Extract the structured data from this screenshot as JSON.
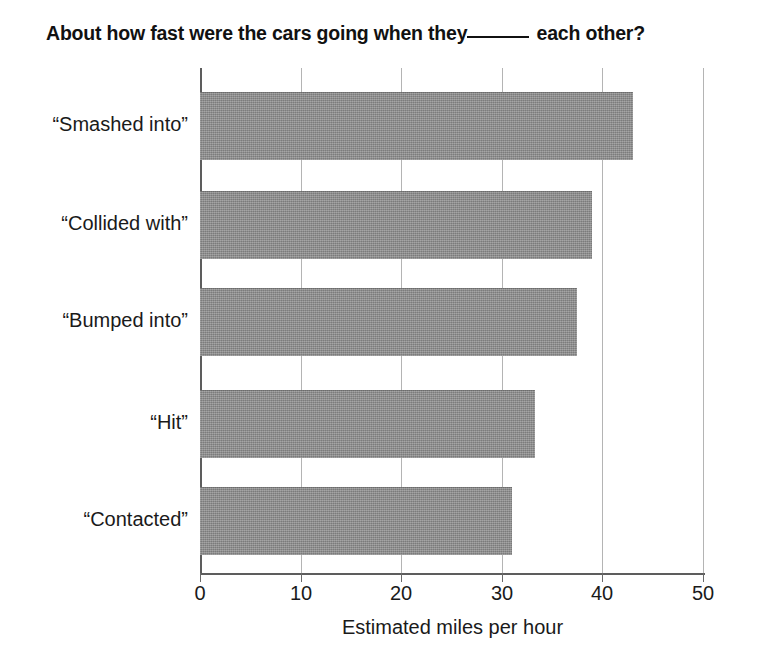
{
  "title": {
    "before_blank": "About how fast were the cars going when they",
    "after_blank": " each other?"
  },
  "chart_data": {
    "type": "bar",
    "orientation": "horizontal",
    "xlabel": "Estimated miles per hour",
    "ylabel": "",
    "categories": [
      "“Smashed into”",
      "“Collided with”",
      "“Bumped into”",
      "“Hit”",
      "“Contacted”"
    ],
    "values": [
      43,
      39,
      37.5,
      33.3,
      31
    ],
    "xlim": [
      0,
      50
    ],
    "xticks": [
      0,
      10,
      20,
      30,
      40,
      50
    ],
    "xtick_labels": [
      "0",
      "10",
      "20",
      "30",
      "40",
      "50"
    ],
    "grid": "vertical-gridlines-at-xticks",
    "legend": "none",
    "bar_color": "#8a8a8a",
    "gridline_color": "#b4b4b4",
    "axis_color": "#5d5d5d"
  }
}
